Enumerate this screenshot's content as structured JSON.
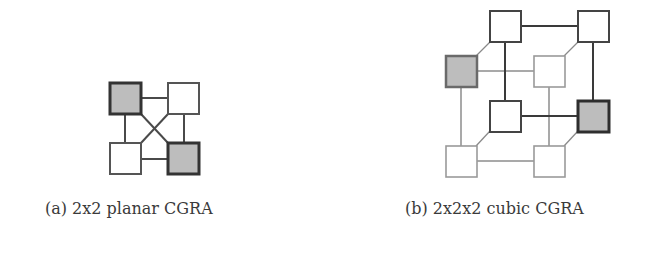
{
  "colors": {
    "dark_stroke": "#3c3c3c",
    "mid_stroke": "#6a6a6a",
    "light_stroke": "#a8a8a8",
    "gray_fill": "#bdbdbd",
    "white_fill": "#ffffff"
  },
  "figures": [
    {
      "id": "a",
      "caption": "(a) 2x2 planar CGRA",
      "kind": "planar",
      "nodes": [
        {
          "name": "node-top-left",
          "x": 110,
          "y": 83,
          "size": 31,
          "highlighted": true
        },
        {
          "name": "node-top-right",
          "x": 168,
          "y": 83,
          "size": 31,
          "highlighted": false
        },
        {
          "name": "node-bottom-left",
          "x": 110,
          "y": 143,
          "size": 31,
          "highlighted": false
        },
        {
          "name": "node-bottom-right",
          "x": 168,
          "y": 143,
          "size": 31,
          "highlighted": true
        }
      ]
    },
    {
      "id": "b",
      "caption": "(b) 2x2x2 cubic CGRA",
      "kind": "cubic",
      "nodes": [
        {
          "name": "node-back-top-left",
          "x": 490,
          "y": 11,
          "size": 31,
          "highlighted": false,
          "layer": "back"
        },
        {
          "name": "node-back-top-right",
          "x": 578,
          "y": 11,
          "size": 31,
          "highlighted": false,
          "layer": "back"
        },
        {
          "name": "node-back-bottom-left",
          "x": 490,
          "y": 101,
          "size": 31,
          "highlighted": false,
          "layer": "back"
        },
        {
          "name": "node-back-bottom-right",
          "x": 578,
          "y": 101,
          "size": 31,
          "highlighted": true,
          "layer": "back"
        },
        {
          "name": "node-front-top-left",
          "x": 446,
          "y": 56,
          "size": 31,
          "highlighted": true,
          "layer": "front"
        },
        {
          "name": "node-front-top-right",
          "x": 534,
          "y": 56,
          "size": 31,
          "highlighted": false,
          "layer": "front"
        },
        {
          "name": "node-front-bottom-left",
          "x": 446,
          "y": 146,
          "size": 31,
          "highlighted": false,
          "layer": "front"
        },
        {
          "name": "node-front-bottom-right",
          "x": 534,
          "y": 146,
          "size": 31,
          "highlighted": false,
          "layer": "front"
        }
      ]
    }
  ]
}
